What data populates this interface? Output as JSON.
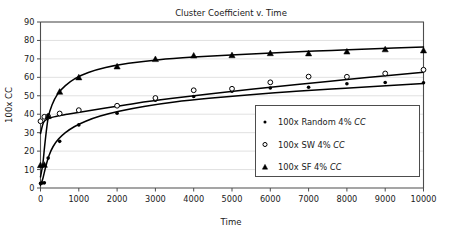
{
  "chart_data": {
    "type": "scatter",
    "title": "Cluster Coefficient v. Time",
    "xlabel": "Time",
    "ylabel": "100x CC",
    "xlim": [
      0,
      10000
    ],
    "ylim": [
      0,
      90
    ],
    "xticks": [
      0,
      1000,
      2000,
      3000,
      4000,
      5000,
      6000,
      7000,
      8000,
      9000,
      10000
    ],
    "yticks": [
      0,
      10,
      20,
      30,
      40,
      50,
      60,
      70,
      80,
      90
    ],
    "xtick_labels": [
      "0",
      "1000",
      "2000",
      "3000",
      "4000",
      "5000",
      "6000",
      "7000",
      "8000",
      "9000",
      "10000"
    ],
    "ytick_labels": [
      "0",
      "10",
      "20",
      "30",
      "40",
      "50",
      "60",
      "70",
      "80",
      "90"
    ],
    "grid": "horizontal",
    "legend_position": "lower-right",
    "series": [
      {
        "name": "100x Random 4% CC",
        "marker": "filled-circle",
        "x": [
          0,
          50,
          100,
          200,
          500,
          1000,
          2000,
          3000,
          4000,
          5000,
          6000,
          7000,
          8000,
          9000,
          10000
        ],
        "y": [
          2.5,
          2.7,
          2.8,
          16.2,
          25.3,
          34.2,
          40.5,
          47.6,
          49.6,
          52.5,
          54.2,
          54.6,
          56.5,
          57.2,
          57.1
        ]
      },
      {
        "name": "100x SW 4% CC",
        "marker": "open-circle",
        "x": [
          0,
          100,
          200,
          500,
          1000,
          2000,
          3000,
          4000,
          5000,
          6000,
          7000,
          8000,
          9000,
          10000
        ],
        "y": [
          36.2,
          38.6,
          38.8,
          40.4,
          42.2,
          44.6,
          48.8,
          53.0,
          53.8,
          57.3,
          60.4,
          60.3,
          62.1,
          64.1
        ]
      },
      {
        "name": "100x SF 4% CC",
        "marker": "filled-triangle",
        "x": [
          0,
          100,
          200,
          500,
          1000,
          2000,
          3000,
          4000,
          5000,
          6000,
          7000,
          8000,
          9000,
          10000
        ],
        "y": [
          12.4,
          12.6,
          39.0,
          52.2,
          60.0,
          65.9,
          69.9,
          71.8,
          72.0,
          73.1,
          73.0,
          74.0,
          75.2,
          74.6
        ]
      }
    ],
    "fit_curves": [
      {
        "name": "random-fit",
        "x": [
          0,
          60,
          130,
          220,
          330,
          470,
          650,
          880,
          1180,
          1560,
          2050,
          2700,
          3500,
          4400,
          5400,
          6500,
          7600,
          8700,
          10000
        ],
        "y": [
          1.5,
          5.0,
          11.0,
          17.5,
          22.5,
          26.5,
          30.0,
          33.2,
          36.2,
          39.0,
          41.6,
          44.2,
          46.6,
          48.6,
          50.4,
          52.2,
          53.7,
          55.0,
          56.6
        ]
      },
      {
        "name": "sw-fit",
        "x": [
          0,
          80,
          200,
          400,
          700,
          1100,
          1700,
          2500,
          3400,
          4400,
          5500,
          6700,
          8000,
          9300,
          10000
        ],
        "y": [
          29.5,
          35.6,
          37.6,
          38.8,
          40.0,
          41.4,
          43.4,
          46.0,
          48.5,
          51.0,
          53.5,
          56.1,
          58.8,
          61.4,
          62.8
        ]
      },
      {
        "name": "sf-fit",
        "x": [
          0,
          60,
          120,
          200,
          300,
          450,
          650,
          900,
          1250,
          1700,
          2300,
          3100,
          4000,
          5100,
          6300,
          7600,
          8900,
          10000
        ],
        "y": [
          6.0,
          13.0,
          25.0,
          38.0,
          45.0,
          51.0,
          55.5,
          59.3,
          62.6,
          65.3,
          67.6,
          69.6,
          71.0,
          72.3,
          73.5,
          74.6,
          75.6,
          76.4
        ]
      }
    ],
    "legend": [
      {
        "marker": "filled-circle",
        "prefix": "100x Random 4% ",
        "italic": "CC"
      },
      {
        "marker": "open-circle",
        "prefix": "100x SW 4% ",
        "italic": "CC"
      },
      {
        "marker": "filled-triangle",
        "prefix": "100x SF 4% ",
        "italic": "CC"
      }
    ],
    "colors": {
      "series": "#000000",
      "grid": "#d9d9d9",
      "axis": "#4d4d4d",
      "background": "#ffffff",
      "text": "#1a1a1a"
    }
  }
}
